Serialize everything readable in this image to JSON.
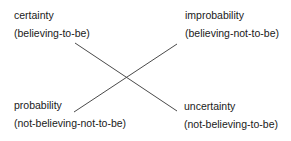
{
  "diagram": {
    "type": "square-of-opposition",
    "line_color": "#4a4a4a",
    "corners": {
      "top_left": {
        "term": "certainty",
        "gloss": "(believing-to-be)"
      },
      "top_right": {
        "term": "improbability",
        "gloss": "(believing-not-to-be)"
      },
      "bottom_left": {
        "term": "probability",
        "gloss": "(not-believing-not-to-be)"
      },
      "bottom_right": {
        "term": "uncertainty",
        "gloss": "(not-believing-to-be)"
      }
    },
    "connectors": [
      {
        "from": "certainty",
        "to": "uncertainty"
      },
      {
        "from": "probability",
        "to": "improbability"
      }
    ]
  }
}
